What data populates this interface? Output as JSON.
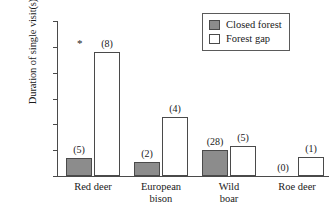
{
  "chart_data": {
    "type": "bar",
    "title": "",
    "xlabel": "",
    "ylabel": "Duration of single visit(s)",
    "ylim": [
      0,
      120
    ],
    "yticks": [
      0,
      20,
      40,
      60,
      80,
      100,
      120
    ],
    "ytick_labels": [
      "0",
      "20",
      "40",
      "60",
      "80",
      "100",
      "120"
    ],
    "grid": false,
    "legend_position": "top-right",
    "categories": [
      "Red deer",
      "European bison",
      "Wild boar",
      "Roe deer"
    ],
    "category_label_lines": [
      [
        "Red deer"
      ],
      [
        "European",
        "bison"
      ],
      [
        "Wild",
        "boar"
      ],
      [
        "Roe deer"
      ]
    ],
    "series": [
      {
        "name": "Closed forest",
        "color": "#8c8c8c",
        "values": [
          14,
          11,
          20,
          0
        ],
        "point_labels": [
          "(5)",
          "(2)",
          "(28)",
          "(0)"
        ],
        "annotations": [
          "",
          "",
          "",
          ""
        ]
      },
      {
        "name": "Forest gap",
        "color": "#ffffff",
        "values": [
          96,
          46,
          23,
          15
        ],
        "point_labels": [
          "(8)",
          "(4)",
          "(5)",
          "(1)"
        ],
        "annotations": [
          "*",
          "",
          "",
          ""
        ]
      }
    ]
  },
  "legend": {
    "items": [
      {
        "label": "Closed forest",
        "swatch": "closed"
      },
      {
        "label": "Forest gap",
        "swatch": "gap"
      }
    ]
  }
}
